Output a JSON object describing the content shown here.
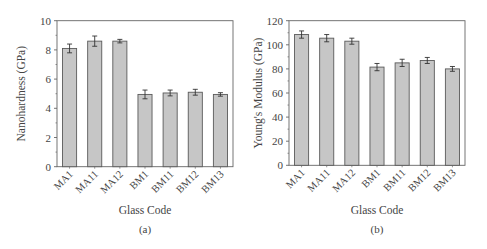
{
  "chart_data": [
    {
      "type": "bar",
      "panel": "(a)",
      "title": "",
      "xlabel": "Glass Code",
      "ylabel": "Nanohardness (GPa)",
      "categories": [
        "MA1",
        "MA11",
        "MA12",
        "BM1",
        "BM11",
        "BM12",
        "BM13"
      ],
      "values": [
        8.1,
        8.6,
        8.6,
        4.95,
        5.05,
        5.1,
        4.95
      ],
      "errors": [
        0.3,
        0.35,
        0.12,
        0.3,
        0.2,
        0.2,
        0.12
      ],
      "ylim": [
        0,
        10
      ],
      "yticks": [
        0,
        2,
        4,
        6,
        8,
        10
      ],
      "grid": false,
      "legend": null,
      "error_bars": true
    },
    {
      "type": "bar",
      "panel": "(b)",
      "title": "",
      "xlabel": "Glass Code",
      "ylabel": "Young's Modulus (GPa)",
      "categories": [
        "MA1",
        "MA11",
        "MA12",
        "BM1",
        "BM11",
        "BM12",
        "BM13"
      ],
      "values": [
        108.5,
        105.5,
        103,
        81.5,
        85,
        87,
        80
      ],
      "errors": [
        3,
        3,
        2.5,
        3,
        3,
        2.5,
        2
      ],
      "ylim": [
        0,
        120
      ],
      "yticks": [
        0,
        20,
        40,
        60,
        80,
        100,
        120
      ],
      "grid": false,
      "legend": null,
      "error_bars": true
    }
  ],
  "colors": {
    "bar_fill": "#c6c6c6",
    "bar_stroke": "#5a5a5a",
    "axis": "#666666",
    "text": "#444444"
  }
}
